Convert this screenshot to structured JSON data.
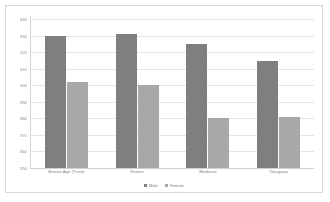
{
  "chart_data": {
    "type": "bar",
    "title": "",
    "xlabel": "",
    "ylabel": "",
    "ylim": [
      350,
      442
    ],
    "yticks": [
      440,
      430,
      420,
      410,
      400,
      390,
      380,
      370,
      360,
      350
    ],
    "ytick_labels": [
      "440",
      "430",
      "420",
      "410",
      "400",
      "390",
      "380",
      "370",
      "360",
      "350"
    ],
    "grid": true,
    "legend_position": "bottom",
    "categories": [
      "Bronze Age (Trent)",
      "Roman",
      "Medieval",
      "Tokugawa"
    ],
    "series": [
      {
        "name": "Male",
        "color": "#7f7f7f",
        "values": [
          430,
          431,
          425,
          415
        ]
      },
      {
        "name": "Female",
        "color": "#a8a8a8",
        "values": [
          402,
          400,
          380,
          381
        ]
      }
    ]
  },
  "legend": {
    "items": [
      {
        "label": "Male",
        "swatch": "male-swatch"
      },
      {
        "label": "Female",
        "swatch": "female-swatch"
      }
    ]
  }
}
